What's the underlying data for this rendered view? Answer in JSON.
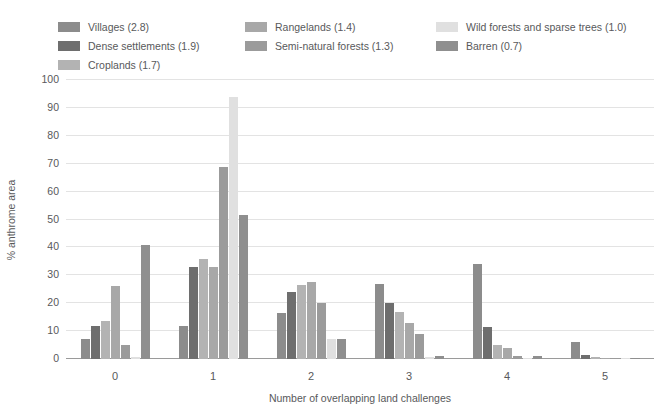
{
  "chart_data": {
    "type": "bar",
    "title": "",
    "xlabel": "Number of overlapping land challenges",
    "ylabel": "% anthrome area",
    "categories": [
      "0",
      "1",
      "2",
      "3",
      "4",
      "5"
    ],
    "ylim": [
      0,
      100
    ],
    "yticks": [
      0,
      10,
      20,
      30,
      40,
      50,
      60,
      70,
      80,
      90,
      100
    ],
    "grid": true,
    "legend_position": "top",
    "series": [
      {
        "name": "Villages (2.8)",
        "label": "Villages (2.8)",
        "color": "#8c8c8c",
        "values": [
          7,
          12,
          16.5,
          27,
          34,
          6
        ]
      },
      {
        "name": "Dense settlements (1.9)",
        "label": "Dense settlements (1.9)",
        "color": "#6e6e6e",
        "values": [
          12,
          33,
          24,
          20,
          11.5,
          1.5
        ]
      },
      {
        "name": "Croplands (1.7)",
        "label": "Croplands (1.7)",
        "color": "#b3b3b3",
        "values": [
          13.5,
          36,
          26.5,
          17,
          5,
          0.6
        ]
      },
      {
        "name": "Rangelands (1.4)",
        "label": "Rangelands (1.4)",
        "color": "#a8a8a8",
        "values": [
          26,
          33,
          27.5,
          13,
          4,
          0.4
        ]
      },
      {
        "name": "Semi-natural forests (1.3)",
        "label": "Semi-natural forests (1.3)",
        "color": "#9b9b9b",
        "values": [
          5,
          69,
          20,
          9,
          1.2,
          0.3
        ]
      },
      {
        "name": "Wild forests and sparse trees (1.0)",
        "label": "Wild forests and sparse trees (1.0)",
        "color": "#e0e0e0",
        "values": [
          0.6,
          94,
          7,
          0.6,
          0.5,
          0.2
        ]
      },
      {
        "name": "Barren (0.7)",
        "label": "Barren (0.7)",
        "color": "#8f8f8f",
        "values": [
          41,
          51.5,
          7,
          1,
          1,
          0.2
        ]
      }
    ]
  },
  "legend": {
    "columns": [
      {
        "items": [
          "Villages (2.8)",
          "Dense settlements (1.9)",
          "Croplands (1.7)"
        ]
      },
      {
        "items": [
          "Rangelands (1.4)",
          "Semi-natural forests (1.3)"
        ]
      },
      {
        "items": [
          "Wild forests and sparse trees (1.0)",
          "Barren (0.7)"
        ]
      }
    ]
  },
  "colors": {
    "villages": "#8c8c8c",
    "dense_settlements": "#6e6e6e",
    "croplands": "#b3b3b3",
    "rangelands": "#a8a8a8",
    "semi_natural_forests": "#9b9b9b",
    "wild_forests": "#e0e0e0",
    "barren": "#8f8f8f",
    "text": "#58595b",
    "gridline": "#e3e3e3",
    "axis": "#9a9a9a",
    "background": "#ffffff"
  }
}
